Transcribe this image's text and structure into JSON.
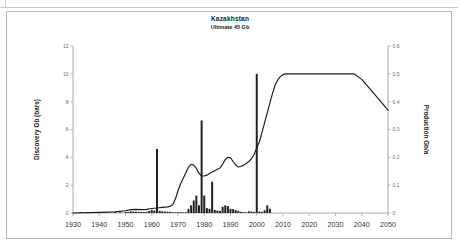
{
  "chart_data": {
    "type": "bar",
    "title": "Kazakhstan",
    "subtitle": "Ultimate  45 Gb",
    "xlabel": "",
    "ylabel": "Discovery Gb (bars)",
    "y2label": "Production Gb/a",
    "xlim": [
      1930,
      2050
    ],
    "ylim": [
      0,
      12
    ],
    "y2lim": [
      0,
      0.6
    ],
    "xticks": [
      1930,
      1940,
      1950,
      1960,
      1970,
      1980,
      1990,
      2000,
      2010,
      2020,
      2030,
      2040,
      2050
    ],
    "yticks": [
      0,
      2,
      4,
      6,
      8,
      10,
      12
    ],
    "y2ticks": [
      0,
      0.1,
      0.2,
      0.3,
      0.4,
      0.5,
      0.6
    ],
    "grid": false,
    "legend": "none",
    "series": [
      {
        "name": "Discovery Gb (bars)",
        "type": "bar",
        "axis": "left",
        "color": "#222222",
        "x": [
          1933,
          1937,
          1941,
          1946,
          1948,
          1950,
          1951,
          1952,
          1953,
          1954,
          1955,
          1956,
          1957,
          1958,
          1959,
          1960,
          1961,
          1962,
          1963,
          1964,
          1965,
          1966,
          1967,
          1968,
          1969,
          1970,
          1971,
          1972,
          1973,
          1974,
          1975,
          1976,
          1977,
          1978,
          1979,
          1980,
          1981,
          1982,
          1983,
          1984,
          1985,
          1986,
          1987,
          1988,
          1989,
          1990,
          1991,
          1992,
          1993,
          1994,
          1995,
          1996,
          1997,
          1998,
          1999,
          2000,
          2001,
          2002,
          2003,
          2004,
          2005
        ],
        "values": [
          0.05,
          0.04,
          0.03,
          0.06,
          0.05,
          0.08,
          0.07,
          0.12,
          0.1,
          0.09,
          0.08,
          0.07,
          0.06,
          0.09,
          0.14,
          0.22,
          0.18,
          4.6,
          0.16,
          0.12,
          0.1,
          0.09,
          0.08,
          0.05,
          0.04,
          0.05,
          0.06,
          0.04,
          0.05,
          0.3,
          0.55,
          0.9,
          1.25,
          0.55,
          6.65,
          1.25,
          0.35,
          0.3,
          2.25,
          0.22,
          0.18,
          0.15,
          0.45,
          0.55,
          0.5,
          0.3,
          0.28,
          0.2,
          0.15,
          0.08,
          0.06,
          0.05,
          0.12,
          0.1,
          0.08,
          10.0,
          0.1,
          0.08,
          0.2,
          0.55,
          0.3
        ]
      },
      {
        "name": "Production Gb/a",
        "type": "line",
        "axis": "right",
        "color": "#1c1c1c",
        "x": [
          1930,
          1940,
          1946,
          1950,
          1952,
          1954,
          1956,
          1958,
          1960,
          1962,
          1964,
          1966,
          1967,
          1968,
          1969,
          1970,
          1971,
          1972,
          1973,
          1974,
          1975,
          1976,
          1977,
          1978,
          1979,
          1980,
          1981,
          1982,
          1983,
          1984,
          1985,
          1986,
          1987,
          1988,
          1989,
          1990,
          1991,
          1992,
          1993,
          1994,
          1995,
          1996,
          1997,
          1998,
          1999,
          2000,
          2001,
          2002,
          2003,
          2004,
          2005,
          2006,
          2007,
          2008,
          2009,
          2010,
          2011,
          2012,
          2020,
          2030,
          2037,
          2040,
          2045,
          2050
        ],
        "values": [
          0.0,
          0.002,
          0.004,
          0.008,
          0.012,
          0.013,
          0.012,
          0.013,
          0.016,
          0.018,
          0.02,
          0.022,
          0.024,
          0.03,
          0.05,
          0.08,
          0.105,
          0.125,
          0.145,
          0.165,
          0.175,
          0.172,
          0.16,
          0.142,
          0.134,
          0.133,
          0.136,
          0.142,
          0.147,
          0.152,
          0.157,
          0.162,
          0.175,
          0.192,
          0.2,
          0.198,
          0.185,
          0.172,
          0.165,
          0.168,
          0.172,
          0.178,
          0.185,
          0.195,
          0.21,
          0.235,
          0.255,
          0.29,
          0.325,
          0.36,
          0.395,
          0.43,
          0.46,
          0.478,
          0.49,
          0.497,
          0.5,
          0.5,
          0.5,
          0.5,
          0.5,
          0.48,
          0.425,
          0.37
        ]
      }
    ]
  }
}
